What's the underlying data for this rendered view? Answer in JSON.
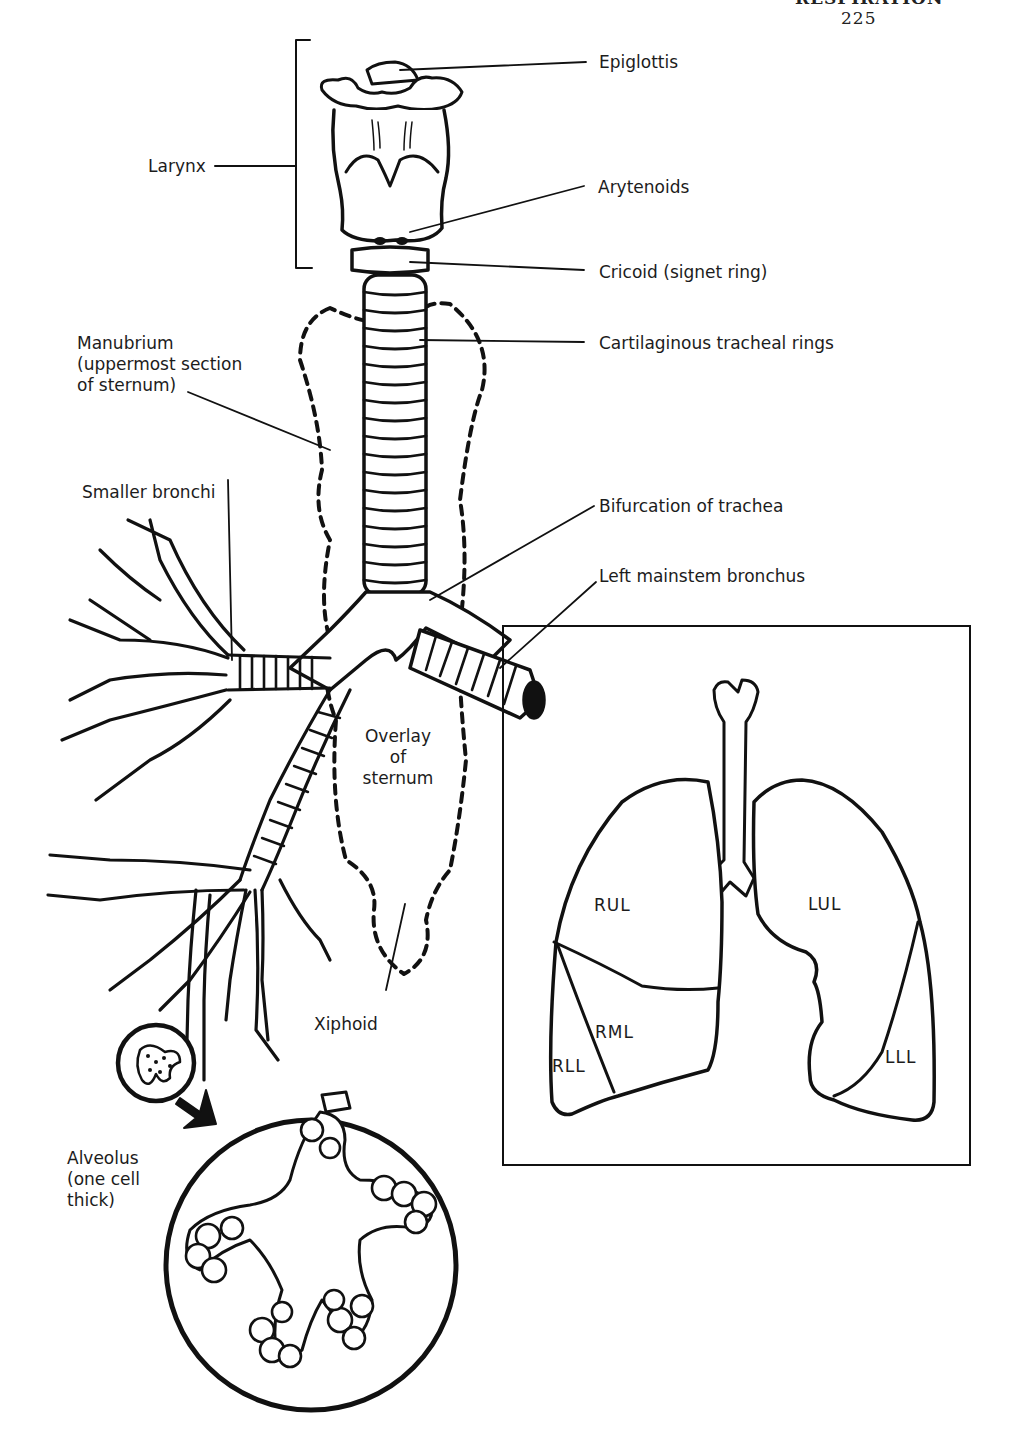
{
  "page_header": {
    "running_title": "RESPIRATION",
    "page_number": "225"
  },
  "figure": {
    "labels": {
      "epiglottis": "Epiglottis",
      "larynx": "Larynx",
      "arytenoids": "Arytenoids",
      "cricoid": "Cricoid (signet ring)",
      "tracheal_rings": "Cartilaginous tracheal rings",
      "manubrium": [
        "Manubrium",
        "(uppermost section",
        "of sternum)"
      ],
      "smaller_bronchi": "Smaller bronchi",
      "bifurcation": "Bifurcation of trachea",
      "left_mainstem": "Left mainstem bronchus",
      "overlay_sternum": [
        "Overlay",
        "of",
        "sternum"
      ],
      "xiphoid": "Xiphoid",
      "alveolus": [
        "Alveolus",
        "(one cell",
        "thick)"
      ]
    },
    "lung_inset": {
      "lobes": {
        "rul": "RUL",
        "rml": "RML",
        "rll": "RLL",
        "lul": "LUL",
        "lll": "LLL"
      }
    }
  },
  "colors": {
    "ink": "#111111",
    "paper": "#ffffff"
  }
}
